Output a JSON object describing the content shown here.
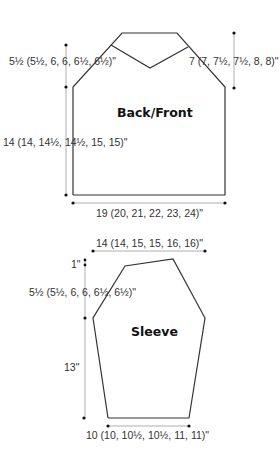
{
  "back_front": {
    "title": "Back/Front",
    "armhole_depth": "5½ (5½, 6, 6, 6½, 6½)\"",
    "shoulder_to_neck": "7 (7, 7½, 7½, 8, 8)\"",
    "body_length": "14 (14, 14½, 14½, 15, 15)\"",
    "width": "19 (20, 21, 22, 23, 24)\""
  },
  "sleeve": {
    "title": "Sleeve",
    "top_width": "14 (14, 15, 15, 16, 16)\"",
    "cap_top": "1\"",
    "cap_depth": "5½ (5½, 6, 6, 6½, 6½)\"",
    "length": "13\"",
    "cuff_width": "10 (10, 10½, 10½, 11, 11)\""
  },
  "colors": {
    "outline": "#333333",
    "measure_line": "#888888",
    "dot": "#111111"
  }
}
